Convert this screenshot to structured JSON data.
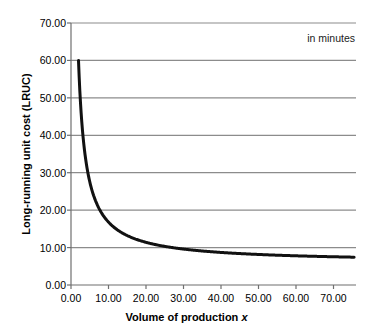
{
  "chart_data": {
    "type": "line",
    "title": "",
    "xlabel": "Volume of production x",
    "ylabel": "Long-running unit cost (LRUC)",
    "annotation": "in minutes",
    "xlim": [
      0,
      76
    ],
    "ylim": [
      0,
      70
    ],
    "grid": true,
    "legend": null,
    "xticks": [
      "0.00",
      "10.00",
      "20.00",
      "30.00",
      "40.00",
      "50.00",
      "60.00",
      "70.00"
    ],
    "xtick_values": [
      0,
      10,
      20,
      30,
      40,
      50,
      60,
      70
    ],
    "yticks": [
      "0.00",
      "10.00",
      "20.00",
      "30.00",
      "40.00",
      "50.00",
      "60.00",
      "70.00"
    ],
    "ytick_values": [
      0,
      10,
      20,
      30,
      40,
      50,
      60,
      70
    ],
    "series": [
      {
        "name": "LRUC",
        "x": [
          2.0,
          2.5,
          3.0,
          3.5,
          4.0,
          4.5,
          5.0,
          6.0,
          7.0,
          8.0,
          9.0,
          10.0,
          12.0,
          14.0,
          16.0,
          18.0,
          20.0,
          24.0,
          28.0,
          32.0,
          36.0,
          40.0,
          45.0,
          50.0,
          55.0,
          60.0,
          65.0,
          70.0,
          75.0
        ],
        "values": [
          60.0,
          52.5,
          47.5,
          43.8,
          41.0,
          38.8,
          37.0,
          34.3,
          32.4,
          30.9,
          29.8,
          28.9,
          27.5,
          26.5,
          25.7,
          25.1,
          24.6,
          23.8,
          23.2,
          22.7,
          22.3,
          22.0,
          21.6,
          21.3,
          21.0,
          20.8,
          20.6,
          20.4,
          20.2
        ]
      }
    ],
    "curve_formula": {
      "form": "a/x + b",
      "a": 108.0,
      "b": 6.0,
      "x_start": 2.0,
      "x_end": 75.5
    },
    "colors": {
      "curve": "#111111",
      "grid": "#8c8c8c",
      "axis": "#6f6f6f",
      "text": "#000000"
    }
  }
}
